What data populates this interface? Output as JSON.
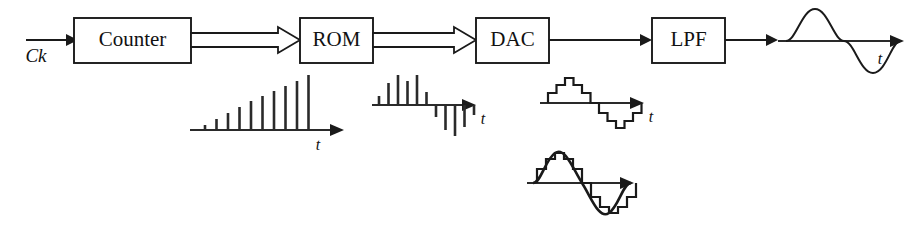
{
  "diagram": {
    "background_color": "#ffffff",
    "line_color": "#1a1a1a",
    "blocks": [
      {
        "id": "counter",
        "label": "Counter",
        "x": 74,
        "y": 18,
        "w": 117,
        "h": 45
      },
      {
        "id": "rom",
        "label": "ROM",
        "x": 300,
        "y": 18,
        "w": 73,
        "h": 45
      },
      {
        "id": "dac",
        "label": "DAC",
        "x": 476,
        "y": 18,
        "w": 73,
        "h": 45
      },
      {
        "id": "lpf",
        "label": "LPF",
        "x": 652,
        "y": 18,
        "w": 73,
        "h": 45
      }
    ],
    "input": {
      "label": "Ck",
      "arrow_from_x": 26,
      "arrow_to_x": 74,
      "arrow_y": 40,
      "label_x": 34,
      "label_y": 61
    },
    "connections": [
      {
        "id": "counter-to-rom",
        "type": "bus",
        "from": "counter",
        "to": "rom",
        "x1": 191,
        "x2": 300,
        "y": 40
      },
      {
        "id": "rom-to-dac",
        "type": "bus",
        "from": "rom",
        "to": "dac",
        "x1": 373,
        "x2": 476,
        "y": 40
      },
      {
        "id": "dac-to-lpf",
        "type": "solid",
        "from": "dac",
        "to": "lpf",
        "x1": 549,
        "x2": 652,
        "y": 40
      },
      {
        "id": "lpf-to-output",
        "type": "solid",
        "from": "lpf",
        "to": "output",
        "x1": 725,
        "x2": 778,
        "y": 40
      }
    ],
    "waveforms": [
      {
        "id": "counter-output",
        "name": "counter-output-waveform",
        "type": "ramp-impulses",
        "axis_label": "t",
        "axis_x1": 190,
        "axis_x2": 315,
        "axis_y": 130,
        "label_x": 305,
        "label_y": 147,
        "stem_heights": [
          5,
          11,
          17,
          23,
          29,
          34,
          39,
          44,
          49,
          55
        ],
        "stem_spacing": 11.5,
        "stem_start_x": 205
      },
      {
        "id": "rom-output",
        "name": "rom-output-waveform",
        "type": "bipolar-impulses",
        "axis_label": "t",
        "axis_x1": 372,
        "axis_x2": 480,
        "axis_y": 105,
        "label_x": 470,
        "label_y": 122,
        "positive_heights": [
          9,
          22,
          30,
          24,
          30,
          13
        ],
        "negative_heights": [
          12,
          25,
          31,
          22,
          10
        ],
        "stem_spacing": 9.5,
        "stem_start_x": 381
      },
      {
        "id": "dac-output",
        "name": "dac-output-staircase",
        "type": "staircase",
        "axis_label": "t",
        "axis_x1": 540,
        "axis_x2": 650,
        "axis_y": 103,
        "label_x": 640,
        "label_y": 120,
        "step_levels": [
          0,
          10,
          18,
          25,
          18,
          10,
          0,
          -10,
          -18,
          -25,
          -18,
          -10,
          0
        ],
        "step_width": 8.5,
        "step_start_x": 556
      },
      {
        "id": "dac-output-smoothed",
        "name": "dac-output-smoothed-waveform",
        "type": "staircase-with-sine",
        "axis_label": "",
        "axis_x1": 527,
        "axis_x2": 648,
        "axis_y": 183,
        "step_levels": [
          0,
          14,
          24,
          30,
          24,
          14,
          0,
          -14,
          -24,
          -30,
          -24,
          -14,
          0
        ],
        "step_width": 9.0,
        "step_start_x": 537
      },
      {
        "id": "lpf-output",
        "name": "lpf-output-sine-waveform",
        "type": "sine",
        "axis_label": "t",
        "axis_x1": 778,
        "axis_x2": 905,
        "axis_y": 41,
        "label_x": 878,
        "label_y": 62,
        "amplitude": 32,
        "cycles": 1,
        "sine_x1": 786,
        "sine_x2": 884
      }
    ]
  }
}
